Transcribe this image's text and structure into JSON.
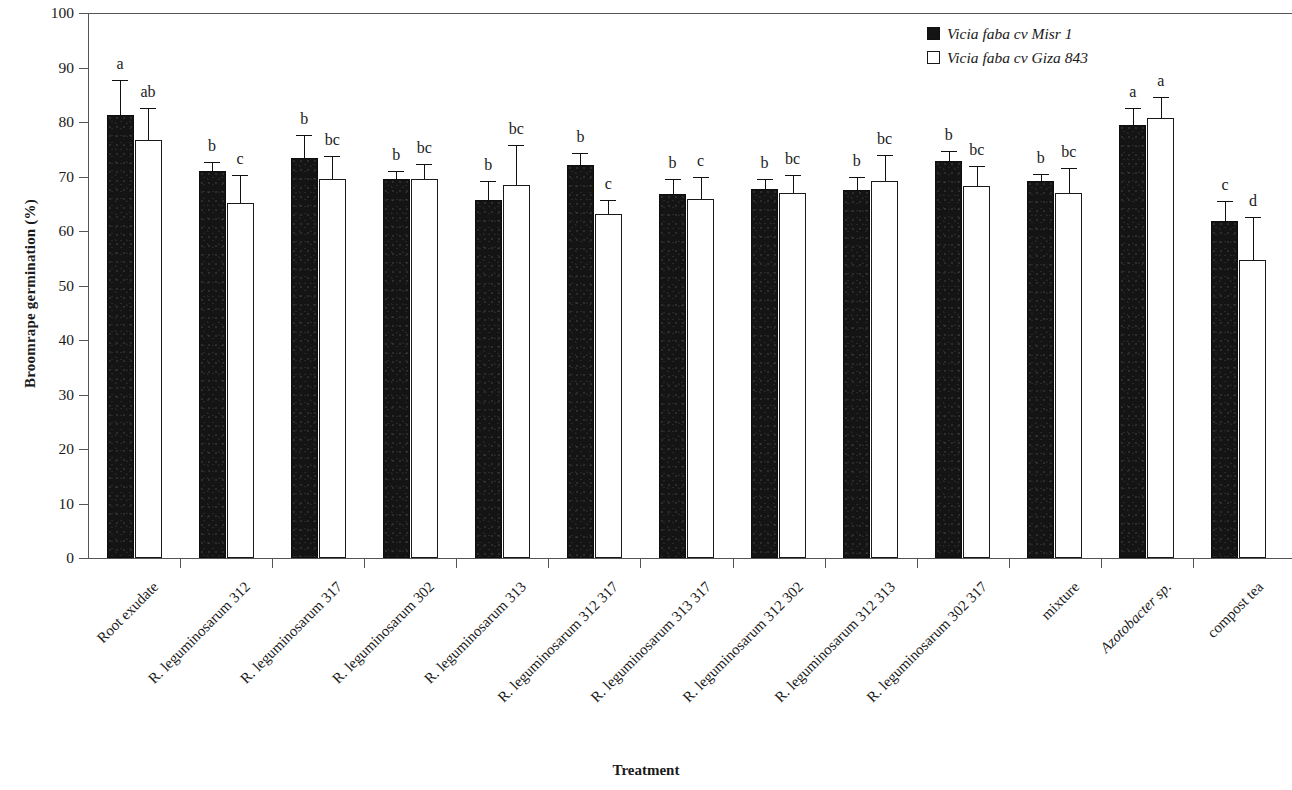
{
  "chart_data": {
    "type": "bar",
    "title": "",
    "xlabel": "Treatment",
    "ylabel": "Broomrape germination (%)",
    "ylim": [
      0,
      100
    ],
    "ytick_step": 10,
    "yticks": [
      0,
      10,
      20,
      30,
      40,
      50,
      60,
      70,
      80,
      90,
      100
    ],
    "grid": false,
    "legend_position": "top-right",
    "categories": [
      "Root exudate",
      "R. leguminosarum 312",
      "R. leguminosarum 317",
      "R. leguminosarum 302",
      "R. leguminosarum 313",
      "R. leguminosarum 312 317",
      "R. leguminosarum 313 317",
      "R. leguminosarum 312 302",
      "R. leguminosarum 312 313",
      "R. leguminosarum 302 317",
      "mixture",
      "Azotobacter sp.",
      "compost tea"
    ],
    "categories_italic": [
      false,
      false,
      false,
      false,
      false,
      false,
      false,
      false,
      false,
      false,
      false,
      true,
      false
    ],
    "series": [
      {
        "name": "Vicia faba cv Misr 1",
        "style": "filled",
        "values": [
          81.2,
          71.0,
          73.4,
          69.6,
          65.7,
          72.1,
          66.8,
          67.7,
          67.6,
          72.9,
          69.1,
          79.4,
          61.9
        ],
        "errors": [
          6.5,
          1.6,
          4.2,
          1.4,
          3.5,
          2.3,
          2.8,
          1.8,
          2.3,
          1.7,
          1.3,
          3.2,
          3.6
        ],
        "letters": [
          "a",
          "b",
          "b",
          "b",
          "b",
          "b",
          "b",
          "b",
          "b",
          "b",
          "b",
          "a",
          "c"
        ]
      },
      {
        "name": "Vicia faba cv Giza 843",
        "style": "hollow",
        "values": [
          76.7,
          65.2,
          69.5,
          69.5,
          68.4,
          63.2,
          65.8,
          67.0,
          69.1,
          68.2,
          66.9,
          80.8,
          54.6
        ],
        "errors": [
          5.8,
          5.0,
          4.2,
          2.8,
          7.3,
          2.4,
          4.1,
          3.3,
          4.9,
          3.8,
          4.7,
          3.8,
          8.0
        ],
        "letters": [
          "ab",
          "c",
          "bc",
          "bc",
          "bc",
          "c",
          "c",
          "bc",
          "bc",
          "bc",
          "bc",
          "a",
          "d"
        ]
      }
    ]
  },
  "colors": {
    "series_filled": "#141414",
    "series_hollow": "#ffffff",
    "axis": "#555555",
    "text": "#1a1a1a"
  }
}
